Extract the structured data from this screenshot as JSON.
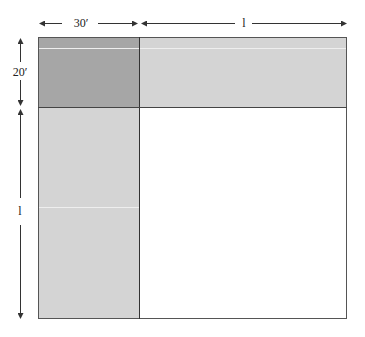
{
  "diagram": {
    "type": "area-model",
    "regions": [
      {
        "id": "corner",
        "description": "30' by 20' corner square",
        "color": "#a6a6a6"
      },
      {
        "id": "top-strip",
        "description": "l by 20' strip",
        "color": "#d4d4d4"
      },
      {
        "id": "left-strip",
        "description": "30' by l strip",
        "color": "#d4d4d4"
      },
      {
        "id": "main",
        "description": "l by l square",
        "color": "#ffffff"
      }
    ],
    "dimensions": {
      "top_left": "30′",
      "top_right": "l",
      "left_top": "20′",
      "left_bottom": "l"
    },
    "colors": {
      "border": "#444444",
      "dark_fill": "#a6a6a6",
      "light_fill": "#d4d4d4",
      "arrow": "#333333"
    }
  }
}
